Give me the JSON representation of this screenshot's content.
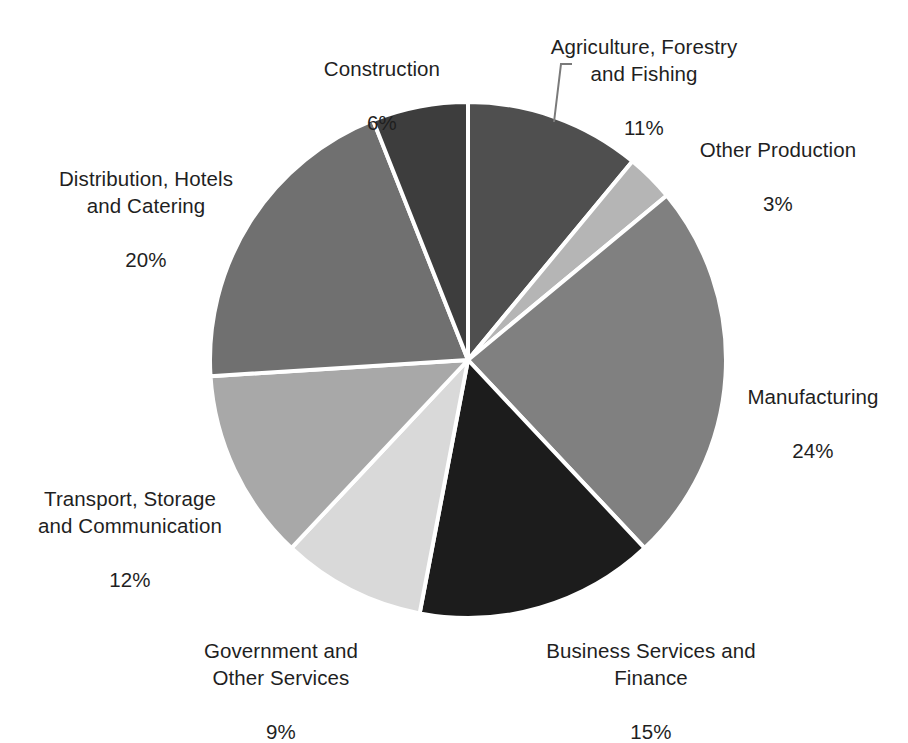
{
  "chart_data": {
    "type": "pie",
    "title": "",
    "subtitle": "",
    "xlabel": "",
    "ylabel": "",
    "legend_position": "none",
    "grid": false,
    "start_angle_deg": 0,
    "direction": "clockwise",
    "categories": [
      "Agriculture, Forestry and Fishing",
      "Other Production",
      "Manufacturing",
      "Business Services and Finance",
      "Government and Other Services",
      "Transport, Storage and Communication",
      "Distribution, Hotels and Catering",
      "Construction"
    ],
    "values": [
      11,
      3,
      24,
      15,
      9,
      12,
      20,
      6
    ],
    "value_unit": "%",
    "colors": [
      "#4f4f4f",
      "#b5b5b5",
      "#808080",
      "#1c1c1c",
      "#d9d9d9",
      "#a8a8a8",
      "#707070",
      "#3d3d3d"
    ],
    "slice_border_color": "#ffffff",
    "background_color": "#ffffff"
  },
  "labels": [
    {
      "id": "agriculture",
      "name": "Agriculture, Forestry\nand Fishing",
      "value": "11%",
      "color": "#4f4f4f"
    },
    {
      "id": "other_prod",
      "name": "Other Production",
      "value": "3%",
      "color": "#b5b5b5"
    },
    {
      "id": "manufacturing",
      "name": "Manufacturing",
      "value": "24%",
      "color": "#808080"
    },
    {
      "id": "business",
      "name": "Business Services and\nFinance",
      "value": "15%",
      "color": "#1c1c1c"
    },
    {
      "id": "government",
      "name": "Government and\nOther Services",
      "value": "9%",
      "color": "#d9d9d9"
    },
    {
      "id": "transport",
      "name": "Transport, Storage\nand Communication",
      "value": "12%",
      "color": "#a8a8a8"
    },
    {
      "id": "distribution",
      "name": "Distribution, Hotels\nand Catering",
      "value": "20%",
      "color": "#707070"
    },
    {
      "id": "construction",
      "name": "Construction",
      "value": "6%",
      "color": "#3d3d3d"
    }
  ],
  "leader_line": {
    "name": "agriculture-leader-line",
    "color": "#7a7a7a"
  }
}
